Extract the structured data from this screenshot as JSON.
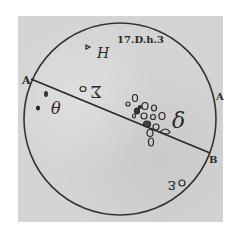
{
  "figure": {
    "caption": "17.D.h.3",
    "labels": {
      "a_left": "A",
      "a_right": "A",
      "b": "B"
    },
    "spot_groups": [
      {
        "id": "H",
        "label": "H"
      },
      {
        "id": "sigma",
        "label": "Σ"
      },
      {
        "id": "theta",
        "label": "θ"
      },
      {
        "id": "delta",
        "label": "δ"
      },
      {
        "id": "epsilon",
        "label": "ε"
      }
    ]
  },
  "colors": {
    "background": "#d4d4d4",
    "ink": "#2a2a2a"
  }
}
